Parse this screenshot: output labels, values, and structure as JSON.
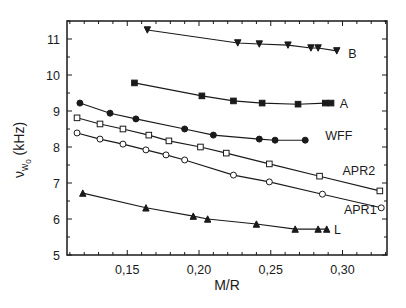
{
  "chart_data": {
    "type": "line",
    "title": "",
    "xlabel": "M/R",
    "ylabel": "ν_w0 (kHz)",
    "ylabel_parts": {
      "symbol": "ν",
      "sub": "w",
      "subsub": "0",
      "unit": "(kHz)"
    },
    "xlim": [
      0.108,
      0.331
    ],
    "ylim": [
      5,
      11.5
    ],
    "x_ticks": [
      0.15,
      0.2,
      0.25,
      0.3
    ],
    "x_tick_labels": [
      "0,15",
      "0,20",
      "0,25",
      "0,30"
    ],
    "x_minor_step": 0.01,
    "y_ticks": [
      5,
      6,
      7,
      8,
      9,
      10,
      11
    ],
    "y_tick_labels": [
      "5",
      "6",
      "7",
      "8",
      "9",
      "10",
      "11"
    ],
    "y_minor_step": 0.5,
    "grid": false,
    "legend": "inline labels at right end of each curve",
    "series": [
      {
        "name": "B",
        "marker": "triangle-down-filled",
        "label_pos": [
          0.304,
          10.62
        ],
        "x": [
          0.164,
          0.227,
          0.242,
          0.262,
          0.278,
          0.283,
          0.296
        ],
        "y": [
          11.25,
          10.89,
          10.86,
          10.83,
          10.75,
          10.75,
          10.67
        ]
      },
      {
        "name": "A",
        "marker": "square-filled",
        "label_pos": [
          0.298,
          9.22
        ],
        "x": [
          0.155,
          0.202,
          0.224,
          0.244,
          0.269,
          0.288,
          0.292
        ],
        "y": [
          9.78,
          9.42,
          9.28,
          9.22,
          9.19,
          9.22,
          9.22
        ]
      },
      {
        "name": "WFF",
        "marker": "circle-filled",
        "label_pos": [
          0.288,
          8.33
        ],
        "x": [
          0.117,
          0.138,
          0.156,
          0.19,
          0.21,
          0.242,
          0.253,
          0.274
        ],
        "y": [
          9.22,
          8.94,
          8.78,
          8.5,
          8.33,
          8.22,
          8.19,
          8.19
        ]
      },
      {
        "name": "APR2",
        "marker": "square-open",
        "label_pos": [
          0.3,
          7.36
        ],
        "x": [
          0.115,
          0.131,
          0.147,
          0.165,
          0.179,
          0.201,
          0.219,
          0.249,
          0.284,
          0.326
        ],
        "y": [
          8.81,
          8.64,
          8.5,
          8.33,
          8.17,
          8.0,
          7.83,
          7.53,
          7.19,
          6.78
        ]
      },
      {
        "name": "APR1",
        "marker": "circle-open",
        "label_pos": [
          0.301,
          6.28
        ],
        "x": [
          0.115,
          0.131,
          0.147,
          0.163,
          0.177,
          0.19,
          0.224,
          0.249,
          0.286,
          0.327
        ],
        "y": [
          8.39,
          8.22,
          8.08,
          7.92,
          7.78,
          7.64,
          7.22,
          7.03,
          6.69,
          6.31
        ]
      },
      {
        "name": "L",
        "marker": "triangle-up-filled",
        "label_pos": [
          0.294,
          5.72
        ],
        "x": [
          0.119,
          0.163,
          0.196,
          0.206,
          0.24,
          0.267,
          0.283,
          0.289
        ],
        "y": [
          6.72,
          6.31,
          6.08,
          6.0,
          5.86,
          5.72,
          5.72,
          5.72
        ]
      }
    ]
  },
  "colors": {
    "ink": "#1a1a1a",
    "background": "#ffffff"
  }
}
